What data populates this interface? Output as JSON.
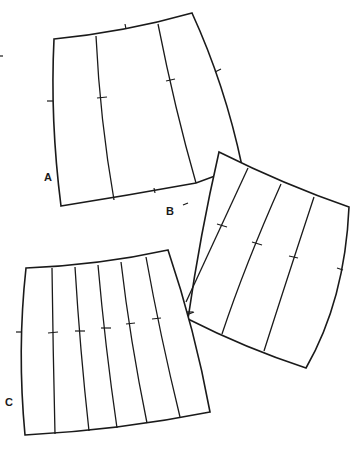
{
  "diagram": {
    "type": "pattern-pieces",
    "pieces": [
      {
        "id": "A",
        "label": "A",
        "panels": 3
      },
      {
        "id": "B",
        "label": "B",
        "panels": 4
      },
      {
        "id": "C",
        "label": "C",
        "panels": 6
      }
    ]
  },
  "labels": {
    "a": "A",
    "b": "B",
    "c": "C"
  },
  "colors": {
    "line": "#1a1a1a",
    "background": "#ffffff"
  }
}
